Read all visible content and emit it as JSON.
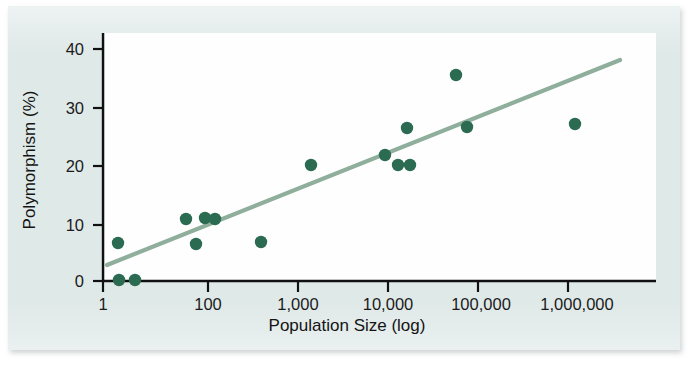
{
  "figure": {
    "background_color": "#dfe9e8",
    "plot_background_color": "#fefefe"
  },
  "chart_data": {
    "type": "scatter",
    "title": "",
    "xlabel": "Population Size (log)",
    "ylabel": "Polymorphism (%)",
    "x_scale": "log",
    "xlim": [
      1,
      1000000
    ],
    "ylim": [
      0,
      43
    ],
    "grid": false,
    "legend": null,
    "marker_color": "#2b6b52",
    "trendline_color": "#8fae9c",
    "axis_color": "#111111",
    "x_tick_labels": [
      "1",
      "100",
      "1,000",
      "10,000",
      "100,000",
      "1,000,000"
    ],
    "x_tick_values": [
      1,
      100,
      1000,
      10000,
      100000,
      1000000
    ],
    "x_tick_px": [
      103,
      208,
      298,
      388,
      478,
      568
    ],
    "y_tick_labels": [
      "0",
      "10",
      "20",
      "30",
      "40"
    ],
    "y_tick_values": [
      0,
      10,
      20,
      30,
      40
    ],
    "y_tick_px": [
      281,
      225,
      166,
      108,
      49
    ],
    "points": [
      {
        "x": 2,
        "y": 5.5,
        "px": 118,
        "py": 243
      },
      {
        "x": 2,
        "y": 0.0,
        "px": 119,
        "py": 280
      },
      {
        "x": 3,
        "y": 0.0,
        "px": 135,
        "py": 280
      },
      {
        "x": 60,
        "y": 10.2,
        "px": 186,
        "py": 219
      },
      {
        "x": 75,
        "y": 6.2,
        "px": 196,
        "py": 244
      },
      {
        "x": 95,
        "y": 10.2,
        "px": 205,
        "py": 218
      },
      {
        "x": 120,
        "y": 10.1,
        "px": 215,
        "py": 219
      },
      {
        "x": 350,
        "y": 6.5,
        "px": 261,
        "py": 242
      },
      {
        "x": 1000,
        "y": 20.5,
        "px": 311,
        "py": 165
      },
      {
        "x": 5000,
        "y": 22.3,
        "px": 385,
        "py": 155
      },
      {
        "x": 8000,
        "y": 20.5,
        "px": 398,
        "py": 165
      },
      {
        "x": 9000,
        "y": 27.0,
        "px": 407,
        "py": 128
      },
      {
        "x": 10000,
        "y": 20.5,
        "px": 410,
        "py": 165
      },
      {
        "x": 30000,
        "y": 36.3,
        "px": 456,
        "py": 75
      },
      {
        "x": 35000,
        "y": 26.8,
        "px": 467,
        "py": 127
      },
      {
        "x": 400000,
        "y": 26.8,
        "px": 575,
        "py": 124
      }
    ],
    "trendline": {
      "x_start_px": 107,
      "y_start_px": 265,
      "x_end_px": 620,
      "y_end_px": 60,
      "y_at_x_start": 2.5,
      "y_at_x_end": 38.5
    },
    "n_points": 16,
    "relationship": "positive"
  }
}
